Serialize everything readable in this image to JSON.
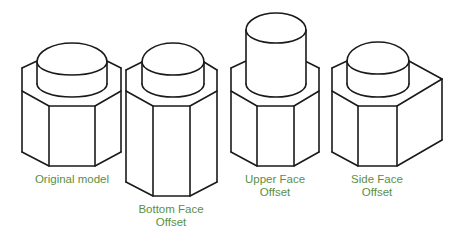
{
  "figure": {
    "label_color": "#5a8f45",
    "line_color": "#1a1a1a",
    "background": "#ffffff"
  },
  "models": [
    {
      "id": "original",
      "label_lines": [
        "Original model"
      ],
      "description": "Hexagonal prism with short cylinder on top"
    },
    {
      "id": "bottom-face-offset",
      "label_lines": [
        "Bottom Face",
        "Offset"
      ],
      "description": "Hexagonal prism extended downward"
    },
    {
      "id": "upper-face-offset",
      "label_lines": [
        "Upper Face",
        "Offset"
      ],
      "description": "Cylinder extended upward"
    },
    {
      "id": "side-face-offset",
      "label_lines": [
        "Side Face",
        "Offset"
      ],
      "description": "Right side face of hexagonal prism extended outward"
    }
  ]
}
